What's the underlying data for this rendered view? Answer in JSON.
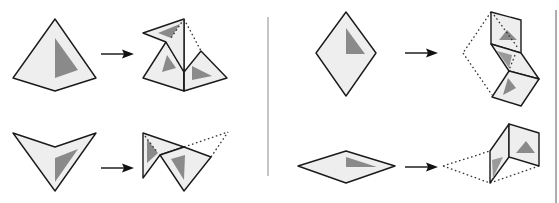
{
  "diagram": {
    "colors": {
      "face_fill": "#eeeeee",
      "outline": "#1a1a1a",
      "mark_fill": "#8a8a8a",
      "divider": "#9e9e9e"
    },
    "panels": [
      {
        "id": "left",
        "examples": [
          {
            "name": "pyramid-net",
            "source_shape": "kite with interior triangle mark",
            "result": "three faces unfolded with one flap lifted"
          },
          {
            "name": "arrowhead-net",
            "source_shape": "concave arrowhead (chevron) with interior triangle mark",
            "result": "two overlapping triangular faces with dotted fold lines"
          }
        ]
      },
      {
        "id": "right",
        "examples": [
          {
            "name": "tall-rhombus-net",
            "source_shape": "tall rhombus with interior triangle mark",
            "result": "zig-zag strip of three rhombic faces with dotted original outline"
          },
          {
            "name": "flat-rhombus-net",
            "source_shape": "flat rhombus with interior triangle mark",
            "result": "two faces folded up vertically with dotted original outline"
          }
        ]
      }
    ],
    "arrows": 4
  }
}
